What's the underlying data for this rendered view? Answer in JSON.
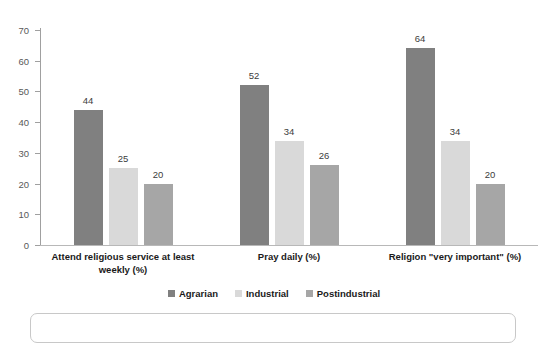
{
  "chart_data": {
    "type": "bar",
    "title": "",
    "subtitle": "",
    "xlabel": "",
    "ylabel": "",
    "ylim": [
      0,
      70
    ],
    "ytick_step": 10,
    "yticks": [
      0,
      10,
      20,
      30,
      40,
      50,
      60,
      70
    ],
    "grid": false,
    "legend_position": "bottom",
    "categories": [
      "Attend religious service at least weekly (%)",
      "Pray daily (%)",
      "Religion \"very important\" (%)"
    ],
    "series": [
      {
        "name": "Agrarian",
        "color": "#808080",
        "values": [
          44,
          52,
          64
        ]
      },
      {
        "name": "Industrial",
        "color": "#d9d9d9",
        "values": [
          25,
          34,
          34
        ]
      },
      {
        "name": "Postindustrial",
        "color": "#a6a6a6",
        "values": [
          20,
          26,
          20
        ]
      }
    ],
    "data_labels": [
      [
        "44",
        "25",
        "20"
      ],
      [
        "52",
        "34",
        "26"
      ],
      [
        "64",
        "34",
        "20"
      ]
    ]
  },
  "axis": {
    "y_tick_labels": [
      "70",
      "60",
      "50",
      "40",
      "30",
      "20",
      "10",
      "0"
    ]
  },
  "legend": {
    "items": [
      {
        "label": "Agrarian"
      },
      {
        "label": "Industrial"
      },
      {
        "label": "Postindustrial"
      }
    ]
  },
  "category_labels": [
    {
      "line1": "Attend religious service at least",
      "line2": "weekly (%)"
    },
    {
      "line1": "Pray daily (%)",
      "line2": ""
    },
    {
      "line1": "Religion \"very important\" (%)",
      "line2": ""
    }
  ]
}
